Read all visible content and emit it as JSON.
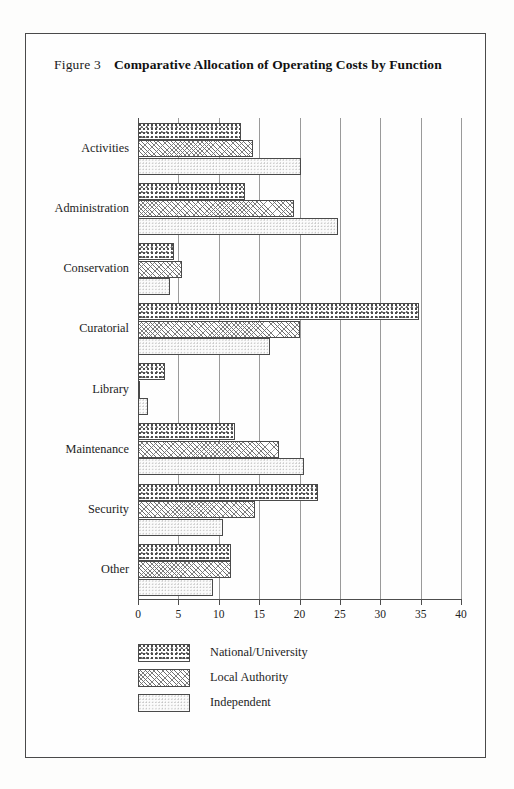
{
  "figure": {
    "label": "Figure 3",
    "title": "Comparative Allocation of Operating Costs by Function"
  },
  "legend": {
    "position": "below-plot",
    "items": [
      {
        "name": "National/University",
        "pattern": "coarse-dots"
      },
      {
        "name": "Local Authority",
        "pattern": "diagonal-hatch"
      },
      {
        "name": "Independent",
        "pattern": "light-stipple"
      }
    ]
  },
  "axis": {
    "x_ticks": [
      "0",
      "5",
      "10",
      "15",
      "20",
      "25",
      "30",
      "35",
      "40"
    ]
  },
  "chart_data": {
    "type": "bar",
    "orientation": "horizontal",
    "title": "Comparative Allocation of Operating Costs by Function",
    "xlabel": "",
    "ylabel": "",
    "xlim": [
      0,
      40
    ],
    "grid": true,
    "legend_position": "below",
    "categories": [
      "Activities",
      "Administration",
      "Conservation",
      "Curatorial",
      "Library",
      "Maintenance",
      "Security",
      "Other"
    ],
    "series": [
      {
        "name": "National/University",
        "values": [
          12.8,
          13.2,
          4.5,
          34.8,
          3.3,
          12.0,
          22.3,
          11.5
        ]
      },
      {
        "name": "Local Authority",
        "values": [
          14.2,
          19.3,
          5.5,
          20.0,
          0.3,
          17.5,
          14.5,
          11.5
        ]
      },
      {
        "name": "Independent",
        "values": [
          20.2,
          24.8,
          4.0,
          16.3,
          1.2,
          20.5,
          10.5,
          9.3
        ]
      }
    ]
  }
}
